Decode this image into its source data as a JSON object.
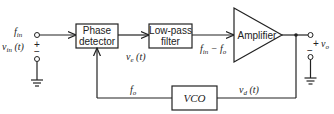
{
  "diagram": {
    "blocks": {
      "phase_detector": {
        "line1": "Phase",
        "line2": "detector"
      },
      "lowpass": {
        "line1": "Low-pass",
        "line2": "filter"
      },
      "amplifier": {
        "label": "Amplifier"
      },
      "vco": {
        "label": "VCO"
      }
    },
    "labels": {
      "fin": "f",
      "fin_sub": "in",
      "vin": "v",
      "vin_sub": "in",
      "vin_arg": " (t)",
      "plus_in": "+",
      "minus_in": "−",
      "ve": "v",
      "ve_sub": "e",
      "ve_arg": " (t)",
      "fdiff": "f",
      "fdiff_sub1": "in",
      "fdiff_mid": " − f",
      "fdiff_sub2": "o",
      "vo": "v",
      "vo_sub": "o",
      "plus_out": "+",
      "minus_out": "−",
      "fo": "f",
      "fo_sub": "o",
      "vd": "v",
      "vd_sub": "d",
      "vd_arg": " (t)"
    }
  }
}
